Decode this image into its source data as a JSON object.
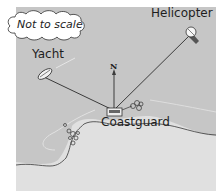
{
  "diagram": {
    "note": "Not to scale",
    "north_label": "N",
    "locations": {
      "helicopter": "Helicopter",
      "yacht": "Yacht",
      "coastguard": "Coastguard"
    },
    "icons": [
      "cloud-callout-icon",
      "helicopter-icon",
      "yacht-icon",
      "coastguard-station-icon",
      "north-arrow-icon",
      "buoy-cluster-icon"
    ],
    "colors": {
      "sea": "#c8c8c8",
      "land": "#e2e2e2",
      "line": "#3a3a3a",
      "background": "#ffffff"
    }
  }
}
